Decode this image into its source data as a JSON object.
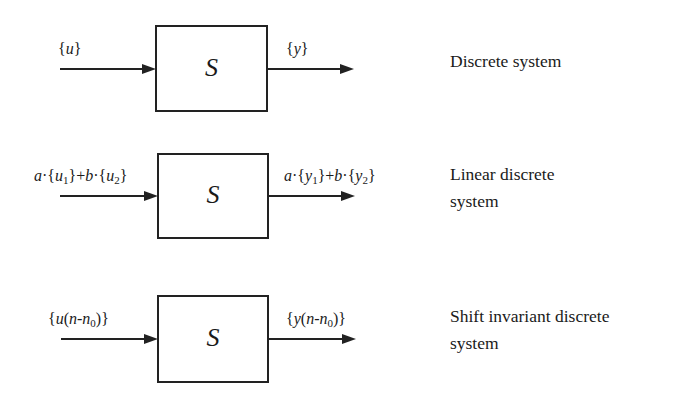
{
  "diagrams": [
    {
      "block": "S",
      "input_label": "{u}",
      "output_label": "{y}",
      "description": [
        "Discrete system"
      ]
    },
    {
      "block": "S",
      "input_label": "a·{u1}+b·{u2}",
      "output_label": "a·{y1}+b·{y2}",
      "description": [
        "Linear discrete",
        "system"
      ]
    },
    {
      "block": "S",
      "input_label": "{u(n-n0)}",
      "output_label": "{y(n-n0)}",
      "description": [
        "Shift invariant discrete",
        "system"
      ]
    }
  ],
  "sig": {
    "lb": "{",
    "rb": "}",
    "dot": "·",
    "plus": "+",
    "a": "a",
    "b": "b",
    "u": "u",
    "y": "u",
    "n": "n",
    "one": "1",
    "two": "2",
    "zero": "0",
    "lp": "(",
    "rp": ")",
    "minus": "-"
  }
}
